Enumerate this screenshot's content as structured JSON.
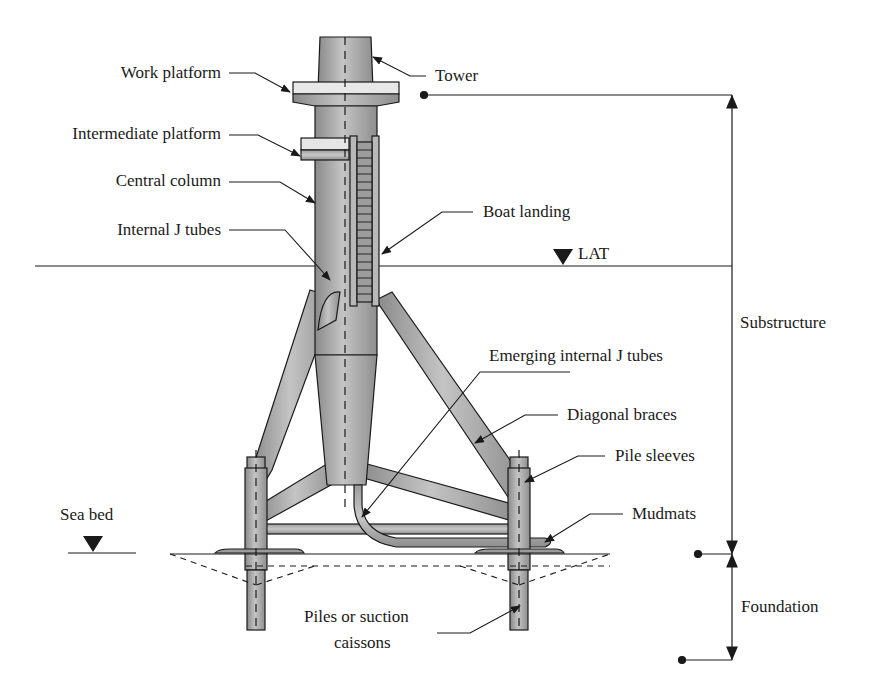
{
  "figure": {
    "labels": {
      "work_platform": "Work platform",
      "intermediate_platform": "Intermediate platform",
      "central_column": "Central column",
      "internal_j_tubes": "Internal J tubes",
      "tower": "Tower",
      "boat_landing": "Boat landing",
      "lat": "LAT",
      "substructure": "Substructure",
      "emerging_internal_j_tubes": "Emerging internal J tubes",
      "diagonal_braces": "Diagonal braces",
      "pile_sleeves": "Pile sleeves",
      "mudmats": "Mudmats",
      "sea_bed": "Sea bed",
      "foundation": "Foundation",
      "piles_line1": "Piles or suction",
      "piles_line2": "caissons"
    },
    "colors": {
      "line": "#1a1a1a",
      "steel_light": "#bdbdbd",
      "steel_mid": "#9a9a9a",
      "steel_dark": "#7d7d7d",
      "background": "#ffffff"
    }
  }
}
